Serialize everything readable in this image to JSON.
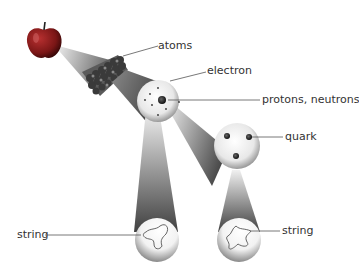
{
  "diagram": {
    "labels": {
      "atoms": "atoms",
      "electron": "electron",
      "protons_neutrons": "protons, neutrons",
      "quark": "quark",
      "string_left": "string",
      "string_right": "string"
    },
    "stages": [
      {
        "name": "apple"
      },
      {
        "name": "atoms"
      },
      {
        "name": "atom",
        "parts": [
          "electron",
          "nucleus"
        ]
      },
      {
        "name": "nucleon",
        "parts": [
          "quark",
          "quark",
          "quark"
        ]
      },
      {
        "name": "string",
        "count": 2
      }
    ],
    "colors": {
      "apple": "#8a1c1c",
      "beam": "#555555",
      "label_text": "#333333",
      "leader_line": "#555555"
    }
  }
}
